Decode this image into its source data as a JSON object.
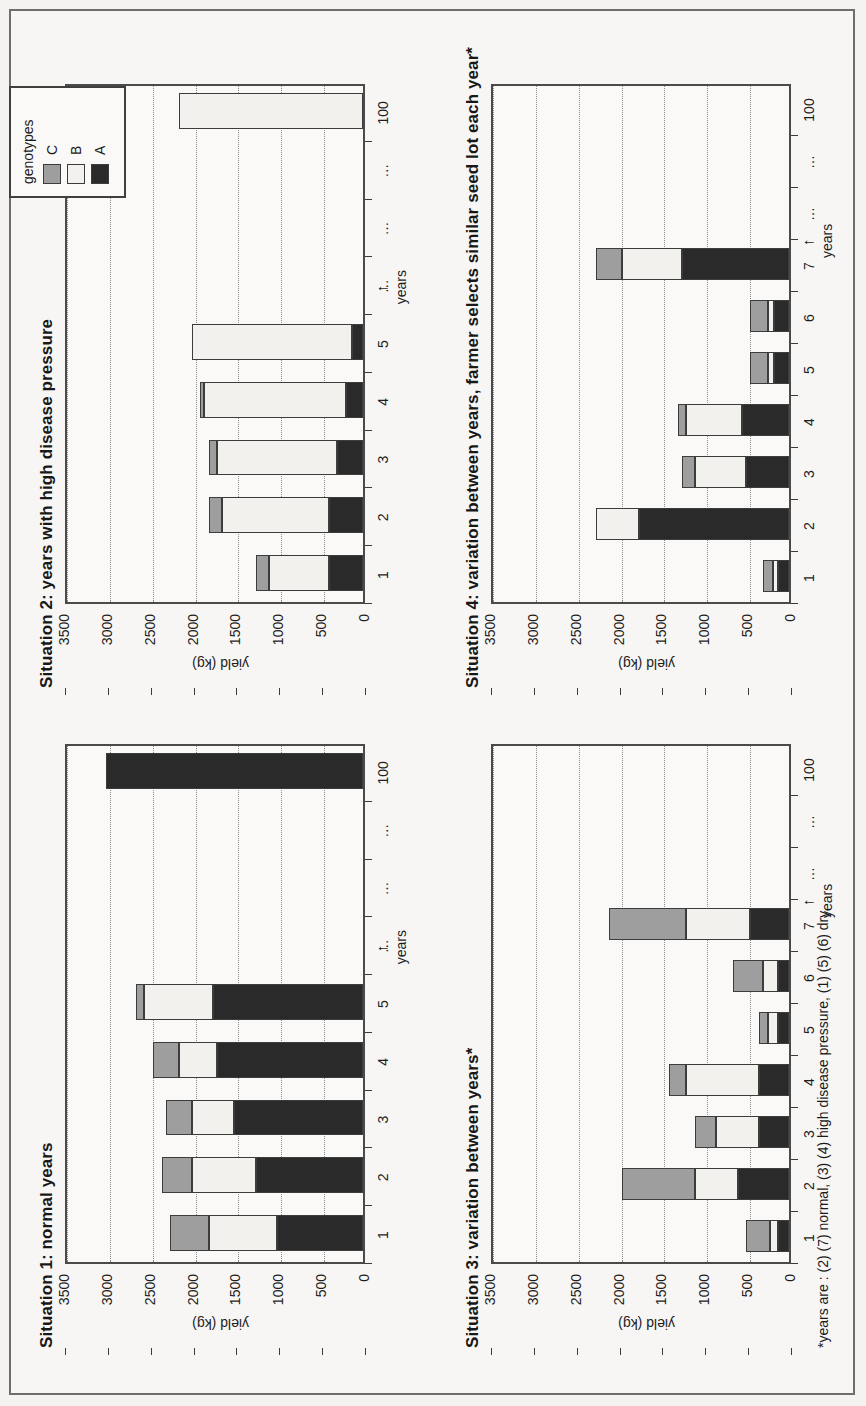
{
  "figure": {
    "footnote": "*years are : (2) (7) normal, (3) (4) high disease pressure, (1) (5) (6) dry,",
    "legend": {
      "title": "genotypes",
      "entries": [
        {
          "label": "C",
          "color": "#9e9e9e"
        },
        {
          "label": "B",
          "color": "#f2f1ee"
        },
        {
          "label": "A",
          "color": "#2a2a2a"
        }
      ]
    }
  },
  "chart_data": [
    {
      "type": "bar",
      "title": "Situation 1: normal years",
      "stacked": true,
      "xlabel": "years",
      "ylabel": "yield (kg)",
      "ylim": [
        0,
        3500
      ],
      "yticks": [
        0,
        500,
        1000,
        1500,
        2000,
        2500,
        3000,
        3500
      ],
      "ytick_labels": [
        "0",
        "500",
        "1000",
        "1500",
        "2000",
        "2500",
        "3000",
        "3500"
      ],
      "categories": [
        "1",
        "2",
        "3",
        "4",
        "5",
        "…",
        "…",
        "…",
        "100"
      ],
      "grid": true,
      "legend_position": "outside-top-right",
      "series": [
        {
          "name": "A",
          "color": "#2a2a2a",
          "values": [
            1000,
            1250,
            1500,
            1700,
            1750,
            0,
            0,
            0,
            3000
          ]
        },
        {
          "name": "B",
          "color": "#f2f1ee",
          "values": [
            800,
            750,
            500,
            450,
            800,
            0,
            0,
            0,
            0
          ]
        },
        {
          "name": "C",
          "color": "#9e9e9e",
          "values": [
            450,
            350,
            300,
            300,
            100,
            0,
            0,
            0,
            0
          ]
        }
      ],
      "totals": [
        2250,
        2350,
        2300,
        2450,
        2650,
        0,
        0,
        0,
        3000
      ]
    },
    {
      "type": "bar",
      "title": "Situation 2: years with high disease pressure",
      "stacked": true,
      "xlabel": "years",
      "ylabel": "yield (kg)",
      "ylim": [
        0,
        3500
      ],
      "yticks": [
        0,
        500,
        1000,
        1500,
        2000,
        2500,
        3000,
        3500
      ],
      "ytick_labels": [
        "0",
        "500",
        "1000",
        "1500",
        "2000",
        "2500",
        "3000",
        "3500"
      ],
      "categories": [
        "1",
        "2",
        "3",
        "4",
        "5",
        "…",
        "…",
        "…",
        "100"
      ],
      "grid": true,
      "series": [
        {
          "name": "A",
          "color": "#2a2a2a",
          "values": [
            400,
            400,
            300,
            200,
            130,
            0,
            0,
            0,
            0
          ]
        },
        {
          "name": "B",
          "color": "#f2f1ee",
          "values": [
            700,
            1250,
            1400,
            1650,
            1870,
            0,
            0,
            0,
            2150
          ]
        },
        {
          "name": "C",
          "color": "#9e9e9e",
          "values": [
            150,
            150,
            100,
            50,
            0,
            0,
            0,
            0,
            0
          ]
        }
      ],
      "totals": [
        1250,
        1800,
        1800,
        1900,
        2000,
        0,
        0,
        0,
        2150
      ]
    },
    {
      "type": "bar",
      "title": "Situation 3: variation between years*",
      "stacked": true,
      "xlabel": "years",
      "ylabel": "yield (kg)",
      "ylim": [
        0,
        3500
      ],
      "yticks": [
        0,
        500,
        1000,
        1500,
        2000,
        2500,
        3000,
        3500
      ],
      "ytick_labels": [
        "0",
        "500",
        "1000",
        "1500",
        "2000",
        "2500",
        "3000",
        "3500"
      ],
      "categories": [
        "1",
        "2",
        "3",
        "4",
        "5",
        "6",
        "7",
        "…",
        "…",
        "100"
      ],
      "grid": true,
      "series": [
        {
          "name": "A",
          "color": "#2a2a2a",
          "values": [
            130,
            600,
            350,
            350,
            130,
            130,
            450,
            0,
            0,
            0
          ]
        },
        {
          "name": "B",
          "color": "#f2f1ee",
          "values": [
            90,
            500,
            500,
            850,
            120,
            170,
            750,
            0,
            0,
            0
          ]
        },
        {
          "name": "C",
          "color": "#9e9e9e",
          "values": [
            280,
            850,
            250,
            200,
            100,
            350,
            900,
            0,
            0,
            0
          ]
        }
      ],
      "totals": [
        500,
        1950,
        1100,
        1400,
        350,
        650,
        2100,
        0,
        0,
        0
      ]
    },
    {
      "type": "bar",
      "title": "Situation 4: variation between years, farmer selects similar seed lot each year*",
      "stacked": true,
      "xlabel": "years",
      "ylabel": "yield (kg)",
      "ylim": [
        0,
        3500
      ],
      "yticks": [
        0,
        500,
        1000,
        1500,
        2000,
        2500,
        3000,
        3500
      ],
      "ytick_labels": [
        "0",
        "500",
        "1000",
        "1500",
        "2000",
        "2500",
        "3000",
        "3500"
      ],
      "categories": [
        "1",
        "2",
        "3",
        "4",
        "5",
        "6",
        "7",
        "…",
        "…",
        "100"
      ],
      "grid": true,
      "series": [
        {
          "name": "A",
          "color": "#2a2a2a",
          "values": [
            130,
            1750,
            500,
            550,
            170,
            170,
            1250,
            0,
            0,
            0
          ]
        },
        {
          "name": "B",
          "color": "#f2f1ee",
          "values": [
            60,
            500,
            600,
            650,
            70,
            70,
            700,
            0,
            0,
            0
          ]
        },
        {
          "name": "C",
          "color": "#9e9e9e",
          "values": [
            110,
            0,
            150,
            100,
            210,
            210,
            300,
            0,
            0,
            0
          ]
        }
      ],
      "totals": [
        300,
        2250,
        1250,
        1300,
        450,
        450,
        2250,
        0,
        0,
        0
      ]
    }
  ]
}
